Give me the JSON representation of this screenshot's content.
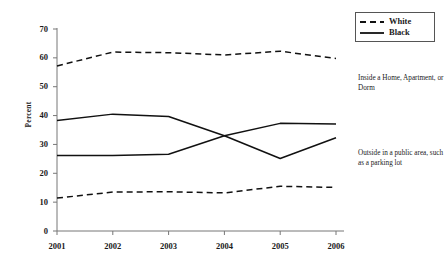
{
  "chart_data": {
    "type": "line",
    "title": "",
    "xlabel": "",
    "ylabel": "Percent",
    "categories": [
      "2001",
      "2002",
      "2003",
      "2004",
      "2005",
      "2006"
    ],
    "x": [
      2001,
      2002,
      2003,
      2004,
      2005,
      2006
    ],
    "ylim": [
      0,
      70
    ],
    "yticks": [
      0,
      10,
      20,
      30,
      40,
      50,
      60,
      70
    ],
    "grid": false,
    "legend_position": "top-right",
    "series": [
      {
        "name": "White",
        "group": "Inside a Home, Apartment, or Dorm",
        "style": "dashed",
        "values": [
          57.2,
          62.0,
          61.8,
          61.0,
          62.3,
          59.8
        ]
      },
      {
        "name": "Black",
        "group": "Inside a Home, Apartment, or Dorm",
        "style": "solid",
        "values": [
          38.3,
          40.5,
          39.7,
          33.0,
          37.3,
          37.1
        ]
      },
      {
        "name": "Black",
        "group": "Outside in a public area, such as a parking lot",
        "style": "solid",
        "values": [
          26.2,
          26.2,
          26.6,
          33.0,
          25.1,
          32.3
        ]
      },
      {
        "name": "White",
        "group": "Outside in a public area, such as a parking lot",
        "style": "dashed",
        "values": [
          11.4,
          13.5,
          13.6,
          13.2,
          15.5,
          15.1
        ]
      }
    ],
    "annotations": [
      {
        "id": "inside",
        "text": "Inside a Home, Apartment, or Dorm"
      },
      {
        "id": "outside",
        "text": "Outside in a public area, such as a parking lot"
      }
    ]
  },
  "legend": {
    "entries": [
      {
        "label": "White",
        "style": "dashed"
      },
      {
        "label": "Black",
        "style": "solid"
      }
    ]
  },
  "axis": {
    "y_label": "Percent",
    "y_ticks": [
      "70",
      "60",
      "50",
      "40",
      "30",
      "20",
      "10",
      "0"
    ],
    "x_ticks": [
      "2001",
      "2002",
      "2003",
      "2004",
      "2005",
      "2006"
    ]
  },
  "annotations": {
    "inside": "Inside a Home, Apartment, or Dorm",
    "outside": "Outside in a public area, such as a parking lot"
  }
}
